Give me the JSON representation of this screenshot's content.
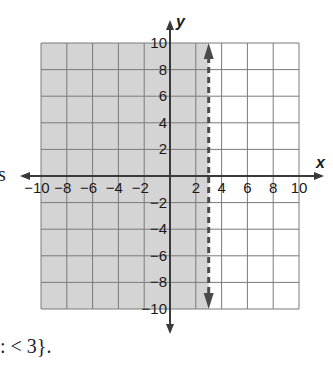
{
  "chart_data": {
    "type": "inequality-graph",
    "title": "",
    "inequality": "x < 3",
    "boundary": {
      "x": 3,
      "style": "dashed",
      "direction": "vertical"
    },
    "shaded_region": "x < 3",
    "xlabel": "x",
    "ylabel": "y",
    "xlim": [
      -10,
      10
    ],
    "ylim": [
      -10,
      10
    ],
    "grid": true,
    "grid_step": 2,
    "x_ticks": [
      "-10",
      "-8",
      "-6",
      "-4",
      "-2",
      "2",
      "4",
      "6",
      "8",
      "10"
    ],
    "y_ticks": [
      "10",
      "8",
      "6",
      "4",
      "2",
      "-2",
      "-4",
      "-6",
      "-8",
      "-10"
    ]
  },
  "text_fragments": {
    "left_cut": "s",
    "bottom_cut": ": < 3}."
  },
  "colors": {
    "shade": "#d4d4d4",
    "grid": "#7a7a7a",
    "axis": "#3a3a3a",
    "boundary": "#4a4a4a"
  }
}
